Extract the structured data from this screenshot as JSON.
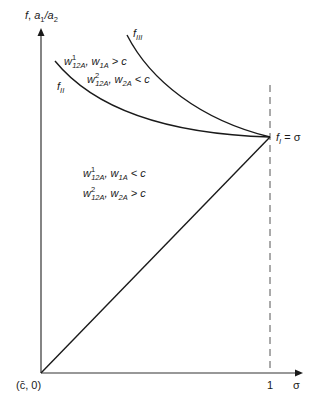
{
  "axes": {
    "y_label_f": "f",
    "y_label_sep": ", ",
    "y_label_a1": "a",
    "y_label_a1_sub": "1",
    "y_label_slash": "/a",
    "y_label_a2_sub": "2",
    "origin_label": "(c̄, 0)",
    "x_tick_1": "1",
    "x_label": "σ"
  },
  "curves": {
    "f_III": {
      "main": "f",
      "sub": "III"
    },
    "f_II": {
      "main": "f",
      "sub": "II"
    },
    "f_I": {
      "main": "f",
      "sub": "I",
      "eq": " = σ"
    }
  },
  "regions": {
    "upper": {
      "line1": {
        "w": "w",
        "sup": "1",
        "sub": "12A",
        "mid": ", w",
        "sub2": "1A",
        "rel": " > c"
      },
      "line2": {
        "w": "w",
        "sup": "2",
        "sub": "12A",
        "mid": ", w",
        "sub2": "2A",
        "rel": " < c"
      }
    },
    "lower": {
      "line1": {
        "w": "w",
        "sup": "1",
        "sub": "12A",
        "mid": ", w",
        "sub2": "1A",
        "rel": " < c"
      },
      "line2": {
        "w": "w",
        "sup": "2",
        "sub": "12A",
        "mid": ", w",
        "sub2": "2A",
        "rel": " > c"
      }
    }
  },
  "colors": {
    "ink": "#1a1a1a",
    "axis": "#333333",
    "dashed": "#555555",
    "background": "#ffffff"
  }
}
